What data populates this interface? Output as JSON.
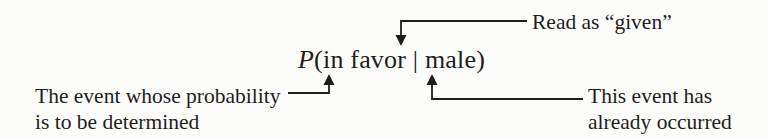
{
  "colors": {
    "paper": "#fcfcfa",
    "ink": "#1e1e1e"
  },
  "formula": {
    "p_symbol": "P",
    "rest": "(in favor | male)"
  },
  "annotations": {
    "given": {
      "label": "Read as “given”"
    },
    "event_determined": {
      "line1": "The event whose probability",
      "line2": "is to be determined"
    },
    "event_occurred": {
      "line1": "This event has",
      "line2": "already occurred"
    }
  }
}
